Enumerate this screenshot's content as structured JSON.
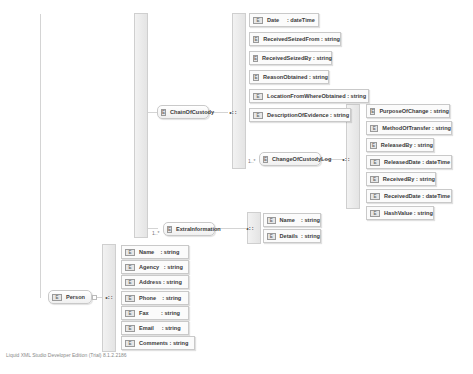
{
  "diagram": {
    "root": {
      "name": "Person",
      "icon": "complex-element-icon"
    },
    "person_children": [
      {
        "label": "Name    : string"
      },
      {
        "label": "Agency   : string"
      },
      {
        "label": "Address : string"
      },
      {
        "label": "Phone    : string"
      },
      {
        "label": "Fax        : string"
      },
      {
        "label": "Email     : string"
      },
      {
        "label": "Comments : string"
      }
    ],
    "chain_of_custody": {
      "name": "ChainOfCustody",
      "children": [
        {
          "label": "Date     : dateTime"
        },
        {
          "label": "ReceivedSeizedFrom : string"
        },
        {
          "label": "ReceivedSeizedBy : string"
        },
        {
          "label": "ReasonObtained : string"
        },
        {
          "label": "LocationFromWhereObtained : string"
        },
        {
          "label": "DescriptionOfEvidence : string"
        }
      ],
      "change_log": {
        "name": "ChangeOfCustodyLog",
        "cardinality": "1..*",
        "children": [
          {
            "label": "PurposeOfChange : string"
          },
          {
            "label": "MethodOfTransfer : string"
          },
          {
            "label": "ReleasedBy : string"
          },
          {
            "label": "ReleasedDate : dateTime"
          },
          {
            "label": "ReceivedBy : string"
          },
          {
            "label": "ReceivedDate : dateTime"
          },
          {
            "label": "HashValue : string"
          }
        ]
      }
    },
    "extra_information": {
      "name": "ExtraInformation",
      "cardinality": "1..*",
      "children": [
        {
          "label": "Name    : string"
        },
        {
          "label": "Details  : string"
        }
      ]
    },
    "element_icon_text": "E",
    "sequence_glyph": "•∷"
  },
  "footer": {
    "text": "Liquid XML Studio Developer Edition (Trial) 8.1.2.2186"
  }
}
